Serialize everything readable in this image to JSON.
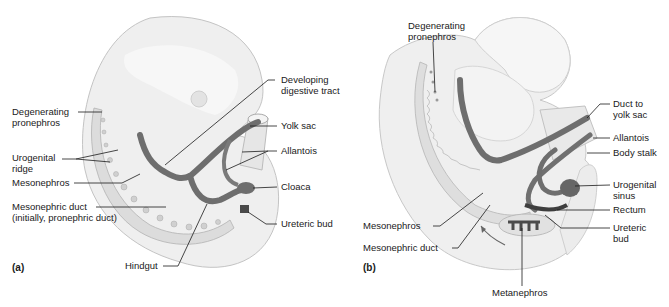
{
  "figure": {
    "colors": {
      "tissue": "#ececec",
      "tissue_edge": "#bdbdbd",
      "duct": "#6e6e6e",
      "duct_dark": "#4a4a4a",
      "text": "#1a1a1a",
      "leader": "#1a1a1a"
    }
  },
  "panel_a": {
    "tag": "(a)",
    "labels": {
      "degenerating_pronephros_1": "Degenerating",
      "degenerating_pronephros_2": "pronephros",
      "urogenital_ridge_1": "Urogenital",
      "urogenital_ridge_2": "ridge",
      "mesonephros": "Mesonephros",
      "mesonephric_duct_1": "Mesonephric duct",
      "mesonephric_duct_2": "(initially, pronephric duct)",
      "hindgut": "Hindgut",
      "developing_digestive_tract_1": "Developing",
      "developing_digestive_tract_2": "digestive tract",
      "yolk_sac": "Yolk sac",
      "allantois": "Allantois",
      "cloaca": "Cloaca",
      "ureteric_bud": "Ureteric bud"
    }
  },
  "panel_b": {
    "tag": "(b)",
    "labels": {
      "degenerating_pronephros_1": "Degenerating",
      "degenerating_pronephros_2": "pronephros",
      "duct_to_yolk_sac_1": "Duct to",
      "duct_to_yolk_sac_2": "yolk sac",
      "allantois": "Allantois",
      "body_stalk": "Body stalk",
      "urogenital_sinus_1": "Urogenital",
      "urogenital_sinus_2": "sinus",
      "rectum": "Rectum",
      "ureteric_bud_1": "Ureteric",
      "ureteric_bud_2": "bud",
      "mesonephros": "Mesonephros",
      "mesonephric_duct": "Mesonephric duct",
      "metanephros": "Metanephros"
    }
  }
}
